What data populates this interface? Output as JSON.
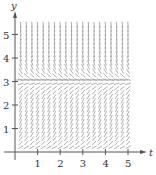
{
  "chart_data": {
    "type": "slope-field",
    "title": "",
    "xlabel": "t",
    "ylabel": "y",
    "xlim": [
      0,
      5.7
    ],
    "ylim": [
      0,
      5.6
    ],
    "x_ticks": [
      "1",
      "2",
      "3",
      "4",
      "5"
    ],
    "y_ticks": [
      "1",
      "2",
      "3",
      "4",
      "5"
    ],
    "grid": false,
    "equilibrium_y": 3,
    "field": {
      "description": "Slope field for dy/dt = y(3 - y); slopes positive for 0<y<3, negative for y>3, zero at y=3",
      "t_start": 0.25,
      "t_end": 5.0,
      "t_step": 0.25,
      "y_start": 0.2,
      "y_end": 5.5,
      "y_step": 0.18,
      "segment_length": 5
    },
    "colors": {
      "axis": "#555555",
      "segment": "#8a8a8a",
      "text": "#333333",
      "background": "#ffffff"
    }
  }
}
